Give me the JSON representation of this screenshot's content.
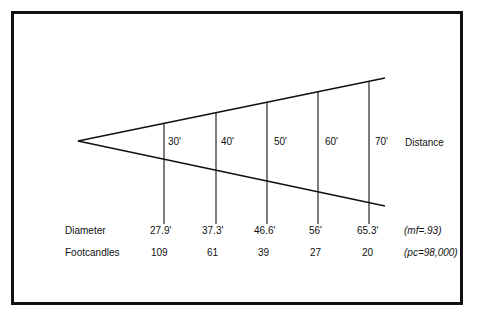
{
  "diagram": {
    "distance_label": "Distance",
    "distances": [
      "30'",
      "40'",
      "50'",
      "60'",
      "70'"
    ],
    "rows": [
      {
        "label": "Diameter",
        "values": [
          "27.9'",
          "37.3'",
          "46.6'",
          "56'",
          "65.3'"
        ],
        "note": "(mf=.93)"
      },
      {
        "label": "Footcandles",
        "values": [
          "109",
          "61",
          "39",
          "27",
          "20"
        ],
        "note": "(pc=98,000)"
      }
    ],
    "colors": {
      "line": "#111111",
      "background": "#ffffff"
    }
  }
}
